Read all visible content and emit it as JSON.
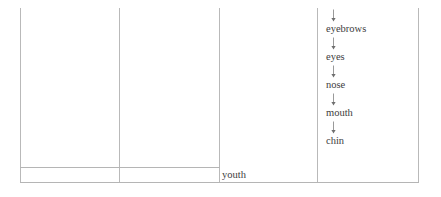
{
  "document": {
    "type": "table-fragment",
    "columns": 4,
    "border_color": "#b9b9b9",
    "text_color": "#3d3d3d",
    "background": "#ffffff"
  },
  "arrow_icon": "down-arrow-icon",
  "chain": {
    "column": 4,
    "steps": [
      {
        "arrow": "↓",
        "label": "eyebrows"
      },
      {
        "arrow": "↓",
        "label": "eyes"
      },
      {
        "arrow": "↓",
        "label": "nose"
      },
      {
        "arrow": "↓",
        "label": "mouth"
      },
      {
        "arrow": "↓",
        "label": "chin"
      }
    ]
  },
  "cells": {
    "youth": "youth"
  }
}
